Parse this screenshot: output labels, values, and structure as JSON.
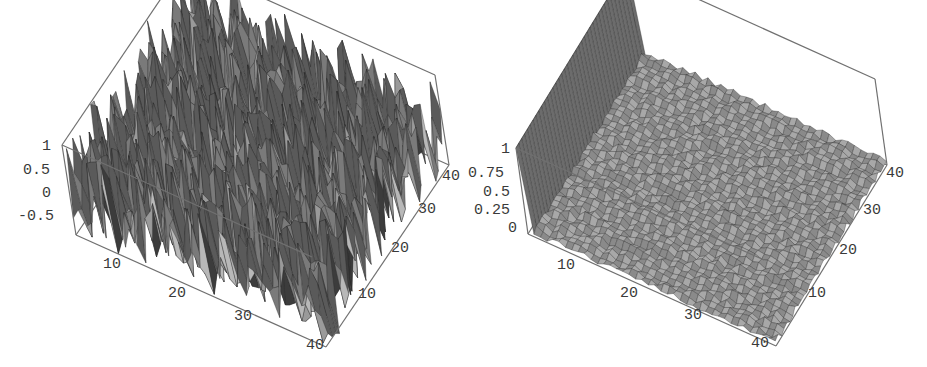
{
  "chart_data": [
    {
      "type": "surface3d",
      "title": "",
      "grid": {
        "nx": 40,
        "ny": 40
      },
      "x_range": [
        1,
        40
      ],
      "y_range": [
        1,
        40
      ],
      "z_range": [
        -0.5,
        1
      ],
      "x_ticks": [
        "10",
        "20",
        "30",
        "40"
      ],
      "y_ticks": [
        "10",
        "20",
        "30",
        "40"
      ],
      "z_ticks": [
        "1",
        "0.5",
        "0",
        "-0.5"
      ],
      "description": "Random noise surface, values roughly uniform in [-0.5, 1]",
      "surface": {
        "kind": "noise",
        "low": -0.6,
        "high": 1.0,
        "seed": 7
      },
      "box_color": "#707070",
      "face_shades": [
        "#5a5a5a",
        "#7a7a7a",
        "#9a9a9a",
        "#b8b8b8",
        "#3c3c3c"
      ]
    },
    {
      "type": "surface3d",
      "title": "",
      "grid": {
        "nx": 40,
        "ny": 40
      },
      "x_range": [
        1,
        40
      ],
      "y_range": [
        1,
        40
      ],
      "z_range": [
        0,
        1
      ],
      "x_ticks": [
        "10",
        "20",
        "30",
        "40"
      ],
      "y_ticks": [
        "10",
        "20",
        "30",
        "40"
      ],
      "z_ticks": [
        "1",
        "0.75",
        "0.5",
        "0.25",
        "0"
      ],
      "description": "Near-flat low-amplitude surface (~0 to 0.1) with a row of unit spikes along the x=1 edge, one per y index",
      "surface": {
        "kind": "spike-edge",
        "noise": 0.08,
        "spike_height": 1.0,
        "seed": 11
      },
      "box_color": "#707070",
      "face_shades": [
        "#6c6c6c",
        "#8a8a8a",
        "#a8a8a8",
        "#c4c4c4",
        "#505050"
      ]
    }
  ],
  "plots": {
    "left": {
      "z_labels": [
        "1",
        "0.5",
        "0",
        "-0.5"
      ],
      "x_labels": [
        "10",
        "20",
        "30",
        "40"
      ],
      "y_labels": [
        "10",
        "20",
        "30",
        "40"
      ]
    },
    "right": {
      "z_labels": [
        "1",
        "0.75",
        "0.5",
        "0.25",
        "0"
      ],
      "x_labels": [
        "10",
        "20",
        "30",
        "40"
      ],
      "y_labels": [
        "10",
        "20",
        "30",
        "40"
      ]
    }
  }
}
